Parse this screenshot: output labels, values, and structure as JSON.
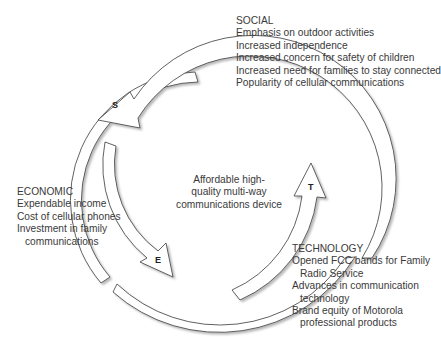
{
  "diagram": {
    "type": "cycle",
    "center": {
      "text_lines": [
        "Affordable high-",
        "quality multi-way",
        "communications device"
      ]
    },
    "social": {
      "heading": "SOCIAL",
      "arrow_letter": "S",
      "items": [
        "Emphasis on outdoor activities",
        "Increased independence",
        "Increased concern for safety of children",
        "Increased need for families to stay connected",
        "Popularity of cellular communications"
      ]
    },
    "economic": {
      "heading": "ECONOMIC",
      "arrow_letter": "E",
      "items": [
        "Expendable income",
        "Cost of cellular phones",
        "Investment in family",
        "communications"
      ]
    },
    "technology": {
      "heading": "TECHNOLOGY",
      "arrow_letter": "T",
      "items": [
        "Opened FCC bands for Family",
        "Radio Service",
        "Advances in communication",
        "technology",
        "Brand equity of Motorola",
        "professional products"
      ]
    },
    "colors": {
      "stroke": "#3a3a3a",
      "fill": "#ffffff",
      "shadow": "#bdbdbd",
      "text": "#3a3a3a"
    }
  }
}
